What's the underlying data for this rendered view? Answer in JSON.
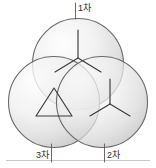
{
  "figure": {
    "background_color": "#ffffff",
    "stroke_color": "#4a4a4a",
    "label_color": "#2b2b2b",
    "circle_fill_light": "#fbfbfb",
    "circle_fill_dark": "#c9c9c9",
    "baseline_color": "#bdbdbd"
  },
  "labels": {
    "primary": "1차",
    "secondary": "2차",
    "tertiary": "3차"
  },
  "windings": [
    {
      "id": "primary",
      "label": "1차",
      "symbol": "wye-icon",
      "position": "top",
      "center_x": 78,
      "center_y": 64,
      "radius": 46
    },
    {
      "id": "tertiary",
      "label": "3차",
      "symbol": "delta-icon",
      "position": "bottom-left",
      "center_x": 54,
      "center_y": 102,
      "radius": 46
    },
    {
      "id": "secondary",
      "label": "2차",
      "symbol": "wye-icon",
      "position": "bottom-right",
      "center_x": 102,
      "center_y": 102,
      "radius": 46
    }
  ]
}
